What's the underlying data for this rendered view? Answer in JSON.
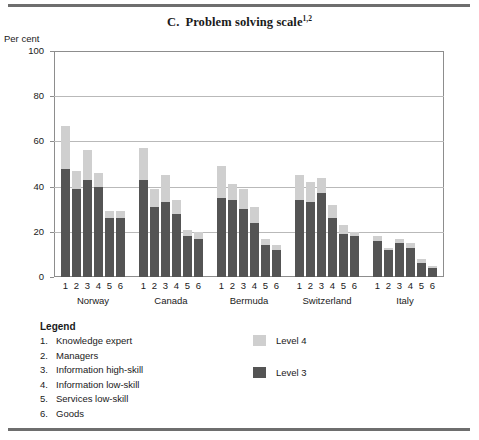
{
  "figure": {
    "letter": "C.",
    "title": "Problem solving scale",
    "title_superscript": "1,2",
    "unit_label": "Per cent"
  },
  "legend": {
    "heading": "Legend",
    "items": [
      {
        "num": "1.",
        "label": "Knowledge expert"
      },
      {
        "num": "2.",
        "label": "Managers"
      },
      {
        "num": "3.",
        "label": "Information high-skill"
      },
      {
        "num": "4.",
        "label": "Information low-skill"
      },
      {
        "num": "5.",
        "label": "Services low-skill"
      },
      {
        "num": "6.",
        "label": "Goods"
      }
    ],
    "keys": [
      {
        "label": "Level 4",
        "color": "#cfcfcf"
      },
      {
        "label": "Level 3",
        "color": "#545454"
      }
    ]
  },
  "chart_data": {
    "type": "bar",
    "stacked": true,
    "xlabel": "",
    "ylabel": "Per cent",
    "ylim": [
      0,
      100
    ],
    "yticks": [
      0,
      20,
      40,
      60,
      80,
      100
    ],
    "grid": true,
    "legend_position": "below-right",
    "groups": [
      "Norway",
      "Canada",
      "Bermuda",
      "Switzerland",
      "Italy"
    ],
    "categories": [
      "1",
      "2",
      "3",
      "4",
      "5",
      "6"
    ],
    "category_labels": [
      "Knowledge expert",
      "Managers",
      "Information high-skill",
      "Information low-skill",
      "Services low-skill",
      "Goods"
    ],
    "series": [
      {
        "name": "Level 3",
        "color": "#545454",
        "values": {
          "Norway": [
            48,
            39,
            43,
            40,
            26,
            26
          ],
          "Canada": [
            43,
            31,
            33,
            28,
            18,
            17
          ],
          "Bermuda": [
            35,
            34,
            30,
            24,
            14,
            12
          ],
          "Switzerland": [
            34,
            33,
            37,
            26,
            19,
            18
          ],
          "Italy": [
            16,
            12,
            15,
            13,
            6,
            4
          ]
        }
      },
      {
        "name": "Level 4",
        "color": "#cfcfcf",
        "values": {
          "Norway": [
            19,
            8,
            13,
            6,
            3,
            3
          ],
          "Canada": [
            14,
            8,
            12,
            6,
            3,
            3
          ],
          "Bermuda": [
            14,
            7,
            9,
            7,
            3,
            2
          ],
          "Switzerland": [
            11,
            9,
            7,
            6,
            4,
            2
          ],
          "Italy": [
            2,
            1,
            2,
            2,
            2,
            1
          ]
        }
      }
    ],
    "totals": {
      "Norway": [
        67,
        47,
        56,
        46,
        29,
        29
      ],
      "Canada": [
        57,
        39,
        45,
        34,
        21,
        20
      ],
      "Bermuda": [
        49,
        41,
        39,
        31,
        17,
        14
      ],
      "Switzerland": [
        45,
        42,
        44,
        32,
        23,
        20
      ],
      "Italy": [
        18,
        13,
        17,
        15,
        8,
        5
      ]
    }
  }
}
